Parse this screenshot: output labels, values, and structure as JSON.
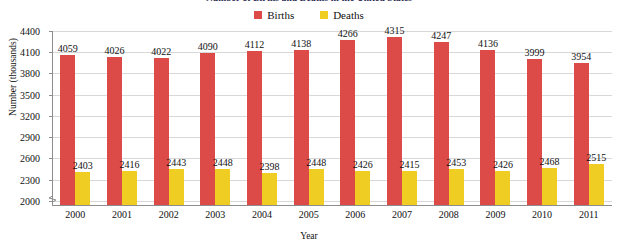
{
  "chart_data": {
    "type": "bar",
    "title": "Number of Births and Deaths in the United States",
    "xlabel": "Year",
    "ylabel": "Number (thousands)",
    "categories": [
      "2000",
      "2001",
      "2002",
      "2003",
      "2004",
      "2005",
      "2006",
      "2007",
      "2008",
      "2009",
      "2010",
      "2011"
    ],
    "series": [
      {
        "name": "Births",
        "color": "#dd4b48",
        "values": [
          4059,
          4026,
          4022,
          4090,
          4112,
          4138,
          4266,
          4315,
          4247,
          4136,
          3999,
          3954
        ]
      },
      {
        "name": "Deaths",
        "color": "#f0cd23",
        "values": [
          2403,
          2416,
          2443,
          2448,
          2398,
          2448,
          2426,
          2415,
          2453,
          2426,
          2468,
          2515
        ]
      }
    ],
    "ylim": [
      1940,
      4400
    ],
    "yticks": [
      2000,
      2300,
      2600,
      2900,
      3200,
      3500,
      3800,
      4100,
      4400
    ],
    "grid": true,
    "legend_position": "top-center",
    "axis_break": true,
    "data_labels": true
  }
}
